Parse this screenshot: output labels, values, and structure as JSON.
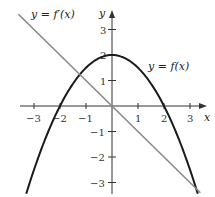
{
  "chart_data": {
    "type": "line",
    "title": "",
    "xlabel": "x",
    "ylabel": "y",
    "xlim": [
      -3.5,
      3.5
    ],
    "ylim": [
      -3.5,
      3.5
    ],
    "x_ticks": [
      -3,
      -2,
      -1,
      1,
      2,
      3
    ],
    "y_ticks": [
      3,
      2,
      1,
      -1,
      -2,
      -3
    ],
    "grid": false,
    "series": [
      {
        "name": "y = f(x)",
        "description": "downward parabola f(x) = 2 - x^2/2, roots at x = -2 and 2, maximum (0, 2)",
        "x": [
          -3.3,
          -3,
          -2.5,
          -2,
          -1.5,
          -1,
          -0.5,
          0,
          0.5,
          1,
          1.5,
          2,
          2.5,
          3,
          3.3
        ],
        "y": [
          -3.445,
          -2.5,
          -1.125,
          0,
          0.875,
          1.5,
          1.875,
          2,
          1.875,
          1.5,
          0.875,
          0,
          -1.125,
          -2.5,
          -3.445
        ],
        "color": "#1a1a1a"
      },
      {
        "name": "y = f'(x)",
        "description": "line f'(x) = -x",
        "x": [
          -3.6,
          3.4
        ],
        "y": [
          3.6,
          -3.4
        ],
        "color": "#8a8a8a"
      }
    ],
    "annotations": [
      {
        "text": "y = f'(x)",
        "near": "upper-left"
      },
      {
        "text": "y = f(x)",
        "near": "right of vertex"
      }
    ]
  },
  "labels": {
    "fprime": "y = f′(x)",
    "f": "y = f(x)",
    "x_axis": "x",
    "y_axis": "y",
    "x_ticks": [
      "−3",
      "−2",
      "−1",
      "1",
      "2",
      "3"
    ],
    "y_ticks": [
      "3",
      "2",
      "1",
      "−1",
      "−2",
      "−3"
    ]
  }
}
